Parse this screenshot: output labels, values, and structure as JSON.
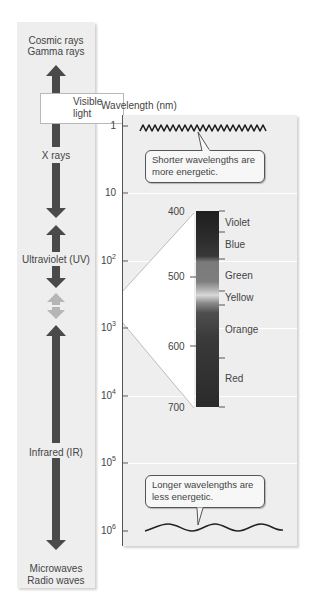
{
  "left_panel": {
    "top_label": [
      "Cosmic rays",
      "Gamma rays"
    ],
    "bands": [
      {
        "label": "X rays"
      },
      {
        "label": "Ultraviolet (UV)"
      },
      {
        "label": "Visible light",
        "lines": [
          "Visible",
          "light"
        ]
      },
      {
        "label": "Infrared (IR)"
      }
    ],
    "bottom_label": [
      "Microwaves",
      "Radio waves"
    ],
    "arrow_color": "#4a4a4a",
    "visible_arrow_color": "#b5b5b5"
  },
  "right_panel": {
    "axis_title": "Wavelength (nm)",
    "ticks": [
      {
        "base": "1",
        "exp": ""
      },
      {
        "base": "10",
        "exp": ""
      },
      {
        "base": "10",
        "exp": "2"
      },
      {
        "base": "10",
        "exp": "3"
      },
      {
        "base": "10",
        "exp": "4"
      },
      {
        "base": "10",
        "exp": "5"
      },
      {
        "base": "10",
        "exp": "6"
      }
    ],
    "callout_top": [
      "Shorter wavelengths are",
      "more energetic."
    ],
    "callout_bottom": [
      "Longer wavelengths are",
      "less energetic."
    ],
    "spectrum": {
      "scale": [
        "400",
        "500",
        "600",
        "700"
      ],
      "colors": [
        "Violet",
        "Blue",
        "Green",
        "Yellow",
        "Orange",
        "Red"
      ]
    }
  }
}
